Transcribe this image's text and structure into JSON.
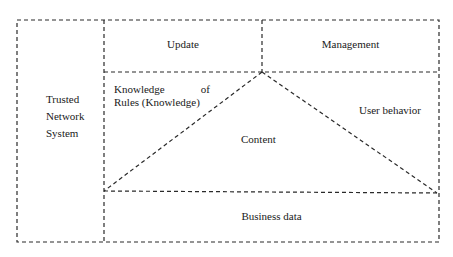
{
  "diagram": {
    "type": "block-diagram",
    "line_style": "dashed",
    "line_color": "#2a2a2a",
    "background": "#ffffff",
    "left_panel": {
      "label_lines": [
        "Trusted",
        "Network",
        "System"
      ]
    },
    "top_row": {
      "left_cell": "Update",
      "right_cell": "Management"
    },
    "middle_region": {
      "triangle_label": "Content",
      "left_label_line1_a": "Knowledge",
      "left_label_line1_b": "of",
      "left_label_line2": "Rules (Knowledge)",
      "right_label": "User behavior"
    },
    "bottom_row": {
      "label": "Business data"
    }
  }
}
